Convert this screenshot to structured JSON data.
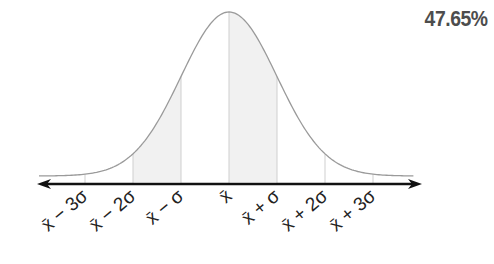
{
  "percentage_label": "47.65%",
  "axis": {
    "mean_x": 229,
    "sigma_px": 48,
    "axis_y": 184,
    "axis_left": 37,
    "axis_right": 422,
    "peak_y": 12,
    "tail_y": 176
  },
  "colors": {
    "curve": "#9a9a9a",
    "axis": "#111111",
    "gridline": "#cfcfcf",
    "shade": "#f1f1f1",
    "text": "#222222",
    "percent": "#4d4d4d"
  },
  "ticks": [
    {
      "offset": -3,
      "label": "x̄ − 3σ"
    },
    {
      "offset": -2,
      "label": "x̄ − 2σ"
    },
    {
      "offset": -1,
      "label": "x̄ − σ"
    },
    {
      "offset": 0,
      "label": "x̄"
    },
    {
      "offset": 1,
      "label": "x̄ + σ"
    },
    {
      "offset": 2,
      "label": "x̄ + 2σ"
    },
    {
      "offset": 3,
      "label": "x̄ + 3σ"
    }
  ],
  "shaded_regions": [
    {
      "from": -2,
      "to": -1
    },
    {
      "from": 0,
      "to": 1
    }
  ]
}
